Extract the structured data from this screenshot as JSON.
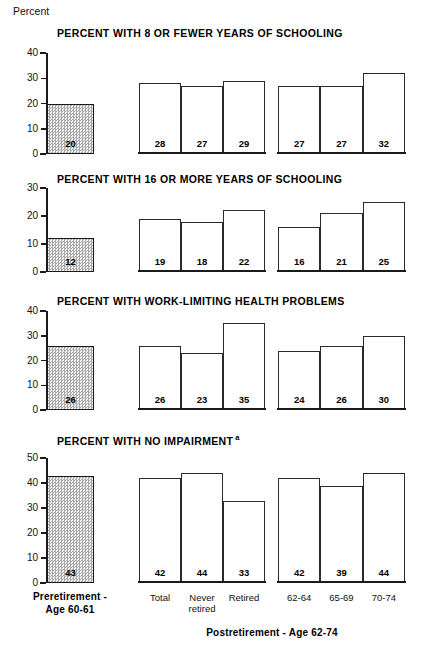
{
  "axis_caption": "Percent",
  "footnote_marker": "a",
  "chart_data": {
    "type": "bar",
    "title": "",
    "xlabel": "",
    "ylabel": "Percent",
    "grid": false,
    "legend_position": "none",
    "orientation": "vertical",
    "note": "Four stacked panels. Each panel shows one shaded preretirement bar (Age 60-61) and two groups of open postretirement bars (Age 62-74): a Total/Never retired/Retired group and a 62-64/65-69/70-74 age group.",
    "group_captions": {
      "left": "Preretirement - Age 60-61",
      "left_line1": "Preretirement -",
      "left_line2": "Age 60-61",
      "bottom": "Postretirement - Age 62-74"
    },
    "categories": [
      "Preretirement Age 60-61",
      "Total",
      "Never retired",
      "Retired",
      "62-64",
      "65-69",
      "70-74"
    ],
    "category_labels": {
      "preretirement": "Preretirement - Age 60-61",
      "total": "Total",
      "never_retired_line1": "Never",
      "never_retired_line2": "retired",
      "retired": "Retired",
      "age_62_64": "62-64",
      "age_65_69": "65-69",
      "age_70_74": "70-74"
    },
    "panels": [
      {
        "title": "PERCENT WITH 8 OR FEWER YEARS OF SCHOOLING",
        "footnote": "",
        "ylim": [
          0,
          40
        ],
        "yticks": [
          0,
          10,
          20,
          30,
          40
        ],
        "ytick_labels": [
          "0",
          "10",
          "20",
          "30",
          "40"
        ],
        "preretirement": {
          "label": "Preretirement - Age 60-61",
          "value": 20
        },
        "postretirement_status": [
          {
            "label": "Total",
            "value": 28
          },
          {
            "label": "Never retired",
            "value": 27
          },
          {
            "label": "Retired",
            "value": 29
          }
        ],
        "postretirement_age": [
          {
            "label": "62-64",
            "value": 27
          },
          {
            "label": "65-69",
            "value": 27
          },
          {
            "label": "70-74",
            "value": 32
          }
        ]
      },
      {
        "title": "PERCENT WITH 16 OR MORE YEARS OF SCHOOLING",
        "footnote": "",
        "ylim": [
          0,
          30
        ],
        "yticks": [
          0,
          10,
          20,
          30
        ],
        "ytick_labels": [
          "0",
          "10",
          "20",
          "30"
        ],
        "preretirement": {
          "label": "Preretirement - Age 60-61",
          "value": 12
        },
        "postretirement_status": [
          {
            "label": "Total",
            "value": 19
          },
          {
            "label": "Never retired",
            "value": 18
          },
          {
            "label": "Retired",
            "value": 22
          }
        ],
        "postretirement_age": [
          {
            "label": "62-64",
            "value": 16
          },
          {
            "label": "65-69",
            "value": 21
          },
          {
            "label": "70-74",
            "value": 25
          }
        ]
      },
      {
        "title": "PERCENT WITH WORK-LIMITING HEALTH PROBLEMS",
        "footnote": "",
        "ylim": [
          0,
          40
        ],
        "yticks": [
          0,
          10,
          20,
          30,
          40
        ],
        "ytick_labels": [
          "0",
          "10",
          "20",
          "30",
          "40"
        ],
        "preretirement": {
          "label": "Preretirement - Age 60-61",
          "value": 26
        },
        "postretirement_status": [
          {
            "label": "Total",
            "value": 26
          },
          {
            "label": "Never retired",
            "value": 23
          },
          {
            "label": "Retired",
            "value": 35
          }
        ],
        "postretirement_age": [
          {
            "label": "62-64",
            "value": 24
          },
          {
            "label": "65-69",
            "value": 26
          },
          {
            "label": "70-74",
            "value": 30
          }
        ]
      },
      {
        "title": "PERCENT WITH NO IMPAIRMENT",
        "footnote": "a",
        "ylim": [
          0,
          50
        ],
        "yticks": [
          0,
          10,
          20,
          30,
          40,
          50
        ],
        "ytick_labels": [
          "0",
          "10",
          "20",
          "30",
          "40",
          "50"
        ],
        "preretirement": {
          "label": "Preretirement - Age 60-61",
          "value": 43
        },
        "postretirement_status": [
          {
            "label": "Total",
            "value": 42
          },
          {
            "label": "Never retired",
            "value": 44
          },
          {
            "label": "Retired",
            "value": 33
          }
        ],
        "postretirement_age": [
          {
            "label": "62-64",
            "value": 42
          },
          {
            "label": "65-69",
            "value": 39
          },
          {
            "label": "70-74",
            "value": 44
          }
        ]
      }
    ]
  }
}
